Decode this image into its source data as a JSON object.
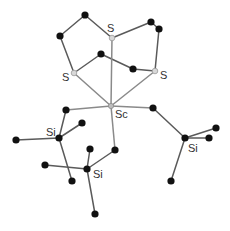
{
  "diagram": {
    "type": "molecular-structure",
    "atoms": [
      {
        "id": "S1",
        "element": "S",
        "x": 112,
        "y": 38,
        "label": "S",
        "lx": 107,
        "ly": 32
      },
      {
        "id": "S2",
        "element": "S",
        "x": 74,
        "y": 73,
        "label": "S",
        "lx": 62,
        "ly": 81
      },
      {
        "id": "S3",
        "element": "S",
        "x": 155,
        "y": 71,
        "label": "S",
        "lx": 160,
        "ly": 79
      },
      {
        "id": "Sc",
        "element": "Sc",
        "x": 111,
        "y": 106,
        "label": "Sc",
        "lx": 115,
        "ly": 118
      },
      {
        "id": "C1",
        "element": "C",
        "x": 85,
        "y": 15
      },
      {
        "id": "C2",
        "element": "C",
        "x": 60,
        "y": 36
      },
      {
        "id": "C3",
        "element": "C",
        "x": 151,
        "y": 22
      },
      {
        "id": "C4",
        "element": "C",
        "x": 159,
        "y": 29
      },
      {
        "id": "C5",
        "element": "C",
        "x": 101,
        "y": 54
      },
      {
        "id": "C6",
        "element": "C",
        "x": 133,
        "y": 69
      },
      {
        "id": "C7",
        "element": "C",
        "x": 66,
        "y": 110
      },
      {
        "id": "C8",
        "element": "C",
        "x": 153,
        "y": 108
      },
      {
        "id": "Si1",
        "element": "Si",
        "x": 59,
        "y": 138,
        "label": "Si",
        "lx": 46,
        "ly": 136
      },
      {
        "id": "C9",
        "element": "C",
        "x": 82,
        "y": 123
      },
      {
        "id": "C10",
        "element": "C",
        "x": 16,
        "y": 140
      },
      {
        "id": "C11",
        "element": "C",
        "x": 72,
        "y": 181
      },
      {
        "id": "Si2",
        "element": "Si",
        "x": 87,
        "y": 169,
        "label": "Si",
        "lx": 93,
        "ly": 178
      },
      {
        "id": "C12",
        "element": "C",
        "x": 90,
        "y": 149
      },
      {
        "id": "C13",
        "element": "C",
        "x": 115,
        "y": 150
      },
      {
        "id": "C14",
        "element": "C",
        "x": 45,
        "y": 165
      },
      {
        "id": "C15",
        "element": "C",
        "x": 95,
        "y": 214
      },
      {
        "id": "Si3",
        "element": "Si",
        "x": 185,
        "y": 138,
        "label": "Si",
        "lx": 188,
        "ly": 152
      },
      {
        "id": "C16",
        "element": "C",
        "x": 216,
        "y": 128
      },
      {
        "id": "C17",
        "element": "C",
        "x": 209,
        "y": 138
      },
      {
        "id": "C18",
        "element": "C",
        "x": 171,
        "y": 181
      }
    ],
    "bonds": [
      [
        "S1",
        "C1"
      ],
      [
        "C1",
        "C2"
      ],
      [
        "C2",
        "S2"
      ],
      [
        "S1",
        "C3"
      ],
      [
        "C3",
        "C4"
      ],
      [
        "C4",
        "S3"
      ],
      [
        "S2",
        "C5"
      ],
      [
        "C5",
        "C6"
      ],
      [
        "C6",
        "S3"
      ],
      [
        "S1",
        "Sc"
      ],
      [
        "S2",
        "Sc"
      ],
      [
        "S3",
        "Sc"
      ],
      [
        "Sc",
        "C7"
      ],
      [
        "C7",
        "Si1"
      ],
      [
        "Si1",
        "C9"
      ],
      [
        "Si1",
        "C10"
      ],
      [
        "Si1",
        "C11"
      ],
      [
        "Sc",
        "C13"
      ],
      [
        "C13",
        "Si2"
      ],
      [
        "Si2",
        "C12"
      ],
      [
        "Si2",
        "C14"
      ],
      [
        "Si2",
        "C15"
      ],
      [
        "Sc",
        "C8"
      ],
      [
        "C8",
        "Si3"
      ],
      [
        "Si3",
        "C16"
      ],
      [
        "Si3",
        "C17"
      ],
      [
        "Si3",
        "C18"
      ]
    ],
    "labels": [
      "S",
      "S",
      "S",
      "Sc",
      "Si",
      "Si",
      "Si"
    ]
  }
}
